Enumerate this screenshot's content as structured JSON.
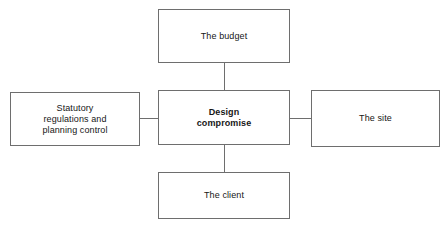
{
  "diagram": {
    "title": "Design compromise",
    "background_color": "#ffffff",
    "border_color": "#6e6e6e",
    "text_color": "#161616",
    "nodes": {
      "center": {
        "label": "Design\ncompromise",
        "emphasis": "bold"
      },
      "top": {
        "label": "The budget",
        "emphasis": "normal"
      },
      "bottom": {
        "label": "The client",
        "emphasis": "normal"
      },
      "left": {
        "label": "Statutory\nregulations and\nplanning control",
        "emphasis": "normal"
      },
      "right": {
        "label": "The site",
        "emphasis": "normal"
      }
    },
    "connectors": [
      {
        "from": "top",
        "to": "center",
        "orientation": "vertical"
      },
      {
        "from": "center",
        "to": "bottom",
        "orientation": "vertical"
      },
      {
        "from": "left",
        "to": "center",
        "orientation": "horizontal"
      },
      {
        "from": "center",
        "to": "right",
        "orientation": "horizontal"
      }
    ]
  }
}
